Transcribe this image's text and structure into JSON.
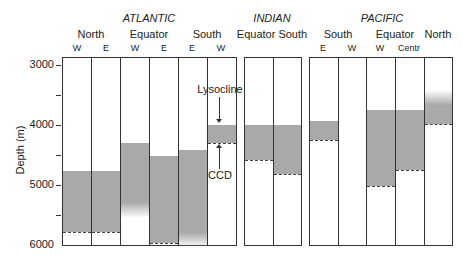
{
  "chart_data": {
    "type": "bar",
    "title": "",
    "ylabel": "Depth (m)",
    "xlabel": "",
    "ylim": [
      6000,
      2870
    ],
    "yticks": [
      3000,
      4000,
      5000,
      6000
    ],
    "minor_tick_interval": 500,
    "annotations": [
      "Lysocline",
      "CCD"
    ],
    "oceans": [
      {
        "name": "ATLANTIC",
        "regions": [
          {
            "name": "North",
            "columns": [
              "W",
              "E"
            ]
          },
          {
            "name": "Equator",
            "columns": [
              "W",
              "E"
            ]
          },
          {
            "name": "South",
            "columns": [
              "E",
              "W"
            ]
          }
        ]
      },
      {
        "name": "INDIAN",
        "regions": [
          {
            "name": "Equator",
            "columns": [
              ""
            ]
          },
          {
            "name": "South",
            "columns": [
              ""
            ]
          }
        ]
      },
      {
        "name": "PACIFIC",
        "regions": [
          {
            "name": "South",
            "columns": [
              "E",
              "W"
            ]
          },
          {
            "name": "Equator",
            "columns": [
              "W",
              "Centr"
            ]
          },
          {
            "name": "North",
            "columns": [
              ""
            ]
          }
        ]
      }
    ],
    "series": [
      {
        "name": "Lysocline (m)",
        "values": [
          4750,
          4750,
          4280,
          4500,
          4400,
          3980,
          3980,
          3980,
          3920,
          null,
          3730,
          3730,
          3400
        ]
      },
      {
        "name": "CCD (m)",
        "values": [
          5770,
          5770,
          null,
          5950,
          null,
          4280,
          4560,
          4800,
          4230,
          null,
          5000,
          4730,
          3960
        ]
      }
    ],
    "categories": [
      "Atlantic North W",
      "Atlantic North E",
      "Atlantic Equator W",
      "Atlantic Equator E",
      "Atlantic South E",
      "Atlantic South W",
      "Indian Equator",
      "Indian South",
      "Pacific South E",
      "Pacific South W",
      "Pacific Equator W",
      "Pacific Equator Centr",
      "Pacific North"
    ],
    "fade_bottom": [
      null,
      null,
      5400,
      null,
      5900,
      null,
      null,
      null,
      null,
      null,
      null,
      null,
      null
    ],
    "fade_top": [
      false,
      false,
      false,
      false,
      false,
      false,
      false,
      false,
      false,
      false,
      false,
      false,
      true
    ]
  },
  "labels": {
    "atlantic": "ATLANTIC",
    "indian": "INDIAN",
    "pacific": "PACIFIC",
    "north": "North",
    "equator": "Equator",
    "south": "South",
    "centr": "Centr",
    "equator_south": "Equator South",
    "W": "W",
    "E": "E",
    "ylabel": "Depth (m)",
    "lysocline": "Lysocline",
    "ccd": "CCD",
    "y3000": "3000",
    "y4000": "4000",
    "y5000": "5000",
    "y6000": "6000"
  }
}
